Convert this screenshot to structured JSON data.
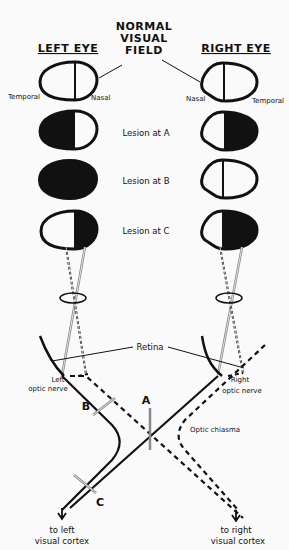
{
  "title": {
    "line1": "NORMAL",
    "line2": "VISUAL",
    "line3": "FIELD"
  },
  "headers": {
    "left_eye": "LEFT EYE",
    "right_eye": "RIGHT EYE"
  },
  "field_labels": {
    "left_temporal": "Temporal",
    "left_nasal": "Nasal",
    "right_nasal": "Nasal",
    "right_temporal": "Temporal"
  },
  "rows": [
    {
      "label": "",
      "left": "none",
      "right": "none"
    },
    {
      "label": "Lesion at A",
      "left": "left-half",
      "right": "right-half"
    },
    {
      "label": "Lesion at B",
      "left": "full",
      "right": "none"
    },
    {
      "label": "Lesion at C",
      "left": "right-half",
      "right": "right-half"
    }
  ],
  "anatomy": {
    "retina": "Retina",
    "left_nerve_line1": "Left",
    "left_nerve_line2": "optic nerve",
    "right_nerve_line1": "Right",
    "right_nerve_line2": "optic nerve",
    "chiasma": "Optic chiasma",
    "lesion_a": "A",
    "lesion_b": "B",
    "lesion_c": "C",
    "left_out_line1": "to left",
    "left_out_line2": "visual cortex",
    "right_out_line1": "to right",
    "right_out_line2": "visual cortex"
  },
  "colors": {
    "ink": "#111111",
    "cut": "#8a8a8a",
    "background": "#fafafa"
  }
}
